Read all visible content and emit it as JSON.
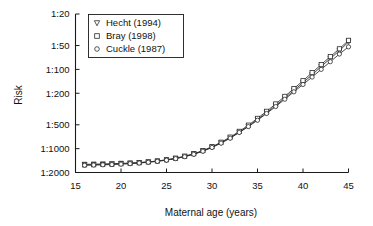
{
  "chart_data": {
    "type": "line",
    "title": "",
    "xlabel": "Maternal age (years)",
    "ylabel": "Risk",
    "xlim": [
      15,
      45
    ],
    "ylim_ratio": [
      20,
      2000
    ],
    "yscale": "log-inverted-ratio",
    "grid": false,
    "legend_position": "top-left",
    "xticks": [
      15,
      20,
      25,
      30,
      35,
      40,
      45
    ],
    "xtick_labels": [
      "15",
      "20",
      "25",
      "30",
      "35",
      "40",
      "45"
    ],
    "yticks_denominator": [
      20,
      50,
      100,
      200,
      500,
      1000,
      2000
    ],
    "ytick_labels": [
      "1:20",
      "1:50",
      "1:100",
      "1:200",
      "1:500",
      "1:1000",
      "1:2000"
    ],
    "x": [
      16,
      17,
      18,
      19,
      20,
      21,
      22,
      23,
      24,
      25,
      26,
      27,
      28,
      29,
      30,
      31,
      32,
      33,
      34,
      35,
      36,
      37,
      38,
      39,
      40,
      41,
      42,
      43,
      44,
      45
    ],
    "series": [
      {
        "name": "Hecht (1994)",
        "marker": "triangle-down",
        "denominators": [
          1580,
          1570,
          1560,
          1550,
          1535,
          1520,
          1500,
          1470,
          1435,
          1390,
          1330,
          1255,
          1170,
          1070,
          960,
          845,
          730,
          620,
          520,
          430,
          352,
          286,
          230,
          184,
          147,
          117,
          92,
          73,
          58,
          45
        ]
      },
      {
        "name": "Bray (1998)",
        "marker": "square",
        "denominators": [
          1600,
          1595,
          1585,
          1570,
          1550,
          1530,
          1505,
          1472,
          1432,
          1382,
          1320,
          1245,
          1158,
          1058,
          945,
          830,
          715,
          605,
          505,
          415,
          338,
          273,
          219,
          175,
          139,
          110,
          87,
          69,
          55,
          43
        ]
      },
      {
        "name": "Cuckle (1987)",
        "marker": "circle",
        "denominators": [
          1620,
          1610,
          1600,
          1588,
          1570,
          1548,
          1520,
          1487,
          1447,
          1398,
          1338,
          1264,
          1178,
          1078,
          966,
          852,
          738,
          626,
          527,
          438,
          360,
          294,
          238,
          192,
          155,
          125,
          100,
          80,
          64,
          52
        ]
      }
    ]
  },
  "legend": {
    "entries": [
      {
        "label": "Hecht (1994)",
        "marker": "triangle-down-icon"
      },
      {
        "label": "Bray (1998)",
        "marker": "square-icon"
      },
      {
        "label": "Cuckle (1987)",
        "marker": "circle-icon"
      }
    ]
  }
}
